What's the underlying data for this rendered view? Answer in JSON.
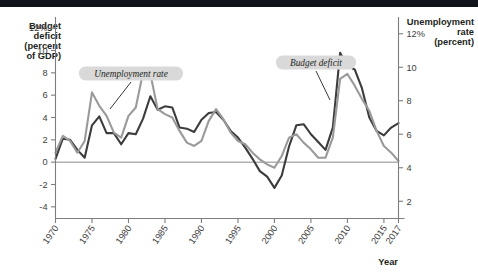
{
  "figure": {
    "left_axis_title_lines": [
      "Budget",
      "deficit",
      "(percent",
      "of GDP)"
    ],
    "right_axis_title_lines": [
      "Unemployment",
      "rate",
      "(percent)"
    ],
    "x_axis_label": "Year",
    "callouts": [
      {
        "name": "unemployment-rate-callout",
        "text": "Unemployment rate"
      },
      {
        "name": "budget-deficit-callout",
        "text": "Budget deficit"
      }
    ],
    "colors": {
      "unemployment_line": "#9a9a9a",
      "budget_line": "#3c3c3c",
      "axis": "#7d7d7d",
      "topbar": "#111418",
      "callout_bg": "#d9d9d9",
      "text": "#231f20"
    }
  },
  "chart_data": {
    "type": "line",
    "title": "",
    "subtitle": "",
    "xlabel": "Year",
    "ylabel": "Budget deficit (percent of GDP)",
    "y2label": "Unemployment rate (percent)",
    "grid": false,
    "legend_position": "inline-callouts",
    "xlim": [
      1970,
      2017
    ],
    "ylim": [
      -5,
      13
    ],
    "y2lim": [
      1,
      13
    ],
    "xticks": [
      1970,
      1975,
      1980,
      1985,
      1990,
      1995,
      2000,
      2005,
      2010,
      2015,
      2017
    ],
    "xtick_labels": [
      "1970",
      "1975",
      "1980",
      "1985",
      "1990",
      "1995",
      "2000",
      "2005",
      "2010",
      "2015",
      "2017"
    ],
    "yticks": [
      -4,
      -2,
      0,
      2,
      4,
      6,
      8,
      10,
      12
    ],
    "ytick_labels": [
      "-4",
      "-2",
      "0",
      "2",
      "4",
      "6",
      "8",
      "10",
      "12%"
    ],
    "y2ticks": [
      2,
      4,
      6,
      8,
      10,
      12
    ],
    "y2tick_labels": [
      "2",
      "4",
      "6",
      "8",
      "10",
      "12%"
    ],
    "zero_reference_line": 0,
    "x": [
      1970,
      1971,
      1972,
      1973,
      1974,
      1975,
      1976,
      1977,
      1978,
      1979,
      1980,
      1981,
      1982,
      1983,
      1984,
      1985,
      1986,
      1987,
      1988,
      1989,
      1990,
      1991,
      1992,
      1993,
      1994,
      1995,
      1996,
      1997,
      1998,
      1999,
      2000,
      2001,
      2002,
      2003,
      2004,
      2005,
      2006,
      2007,
      2008,
      2009,
      2010,
      2011,
      2012,
      2013,
      2014,
      2015,
      2016,
      2017
    ],
    "series": [
      {
        "name": "Budget deficit",
        "axis": "left",
        "units": "percent of GDP",
        "color": "#3c3c3c",
        "values": [
          0.3,
          2.1,
          2.0,
          1.1,
          0.4,
          3.3,
          4.1,
          2.6,
          2.6,
          1.6,
          2.6,
          2.5,
          3.9,
          5.9,
          4.7,
          5.0,
          4.9,
          3.1,
          3.0,
          2.7,
          3.8,
          4.4,
          4.5,
          3.8,
          2.8,
          2.2,
          1.3,
          0.3,
          -0.8,
          -1.3,
          -2.3,
          -1.2,
          1.4,
          3.3,
          3.4,
          2.5,
          1.8,
          1.1,
          3.1,
          9.8,
          8.6,
          8.3,
          6.6,
          4.0,
          2.8,
          2.4,
          3.1,
          3.5
        ]
      },
      {
        "name": "Unemployment rate",
        "axis": "right",
        "units": "percent",
        "color": "#9a9a9a",
        "values": [
          4.9,
          5.9,
          5.6,
          4.9,
          5.6,
          8.5,
          7.7,
          7.1,
          6.1,
          5.8,
          7.1,
          7.6,
          9.7,
          9.6,
          7.5,
          7.2,
          7.0,
          6.2,
          5.5,
          5.3,
          5.6,
          6.8,
          7.5,
          6.9,
          6.1,
          5.6,
          5.4,
          4.9,
          4.5,
          4.2,
          4.0,
          4.7,
          5.8,
          6.0,
          5.5,
          5.1,
          4.6,
          4.6,
          5.8,
          9.3,
          9.6,
          8.9,
          8.1,
          7.4,
          6.2,
          5.3,
          4.9,
          4.4
        ]
      }
    ],
    "annotations": [
      {
        "text": "Unemployment rate",
        "points_to_year": 1980
      },
      {
        "text": "Budget deficit",
        "points_to_year": 2008
      }
    ]
  }
}
